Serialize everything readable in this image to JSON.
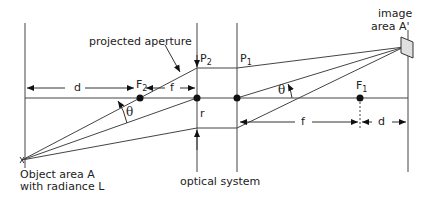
{
  "diagram": {
    "labels": {
      "projected_aperture": "projected aperture",
      "image_area": [
        "image",
        "area A'"
      ],
      "object_area": [
        "Object area A",
        "with radiance L"
      ],
      "optical_system": "optical system",
      "P2_main": "P",
      "P2_sub": "2",
      "P1_main": "P",
      "P1_sub": "1",
      "F2_main": "F",
      "F2_sub": "2",
      "F1_main": "F",
      "F1_sub": "1",
      "d_left": "d",
      "f_left": "f",
      "f_right": "f",
      "d_right": "d",
      "r": "r",
      "theta_left": "θ",
      "theta_right": "θ"
    },
    "colors": {
      "line": "#333333",
      "box_fill": "#e0e0e0"
    }
  }
}
